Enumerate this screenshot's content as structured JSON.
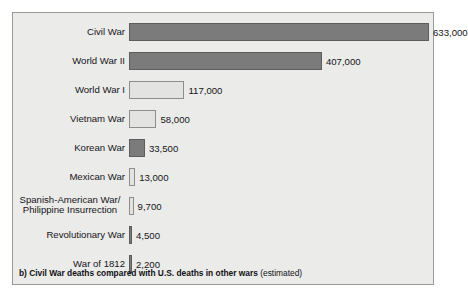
{
  "figure": {
    "caption_main": "b) Civil War deaths compared with U.S. deaths in other wars",
    "caption_note": "(estimated)"
  },
  "colors": {
    "panel_background": "#ebebe9",
    "panel_border": "#9a9a98",
    "bar_dark_fill": "#7b7b7b",
    "bar_dark_border": "#5d5d5d",
    "bar_light_fill": "#e3e3e1",
    "bar_light_border": "#8d8d8b",
    "text": "#15151a"
  },
  "chart_data": {
    "type": "bar",
    "orientation": "horizontal",
    "title": "b) Civil War deaths compared with U.S. deaths in other wars (estimated)",
    "xlabel": "",
    "ylabel": "",
    "grid": false,
    "legend": "none",
    "xlim": [
      0,
      633000
    ],
    "categories": [
      "Civil War",
      "World War II",
      "World War I",
      "Vietnam War",
      "Korean War",
      "Mexican War",
      "Spanish-American War/\nPhilippine Insurrection",
      "Revolutionary War",
      "War of 1812"
    ],
    "values": [
      633000,
      407000,
      117000,
      58000,
      33500,
      13000,
      9700,
      4500,
      2200
    ],
    "value_labels": [
      "633,000",
      "407,000",
      "117,000",
      "58,000",
      "33,500",
      "13,000",
      "9,700",
      "4,500",
      "2,200"
    ],
    "bar_shades": [
      "dark",
      "dark",
      "light",
      "light",
      "dark",
      "light",
      "light",
      "dark",
      "dark"
    ]
  }
}
